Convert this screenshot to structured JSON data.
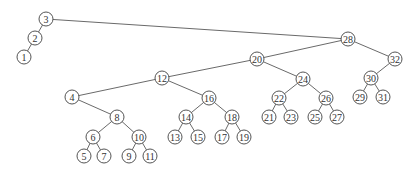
{
  "diagram": {
    "type": "binary-search-tree",
    "node_radius": 7,
    "colors": {
      "edge": "#6a6a6a",
      "node_stroke": "#555555",
      "node_fill": "#ffffff",
      "text": "#333333"
    },
    "nodes": [
      {
        "id": "3",
        "label": "3",
        "x": 46,
        "y": 19
      },
      {
        "id": "2",
        "label": "2",
        "x": 35,
        "y": 38
      },
      {
        "id": "1",
        "label": "1",
        "x": 24,
        "y": 57
      },
      {
        "id": "28",
        "label": "28",
        "x": 348,
        "y": 39
      },
      {
        "id": "20",
        "label": "20",
        "x": 257,
        "y": 59
      },
      {
        "id": "32",
        "label": "32",
        "x": 395,
        "y": 59
      },
      {
        "id": "12",
        "label": "12",
        "x": 162,
        "y": 78
      },
      {
        "id": "24",
        "label": "24",
        "x": 303,
        "y": 79
      },
      {
        "id": "30",
        "label": "30",
        "x": 371,
        "y": 78
      },
      {
        "id": "4",
        "label": "4",
        "x": 72,
        "y": 97
      },
      {
        "id": "16",
        "label": "16",
        "x": 209,
        "y": 98
      },
      {
        "id": "22",
        "label": "22",
        "x": 279,
        "y": 98
      },
      {
        "id": "26",
        "label": "26",
        "x": 326,
        "y": 98
      },
      {
        "id": "29",
        "label": "29",
        "x": 360,
        "y": 97
      },
      {
        "id": "31",
        "label": "31",
        "x": 383,
        "y": 97
      },
      {
        "id": "8",
        "label": "8",
        "x": 117,
        "y": 117
      },
      {
        "id": "14",
        "label": "14",
        "x": 186,
        "y": 117
      },
      {
        "id": "18",
        "label": "18",
        "x": 232,
        "y": 117
      },
      {
        "id": "21",
        "label": "21",
        "x": 269,
        "y": 117
      },
      {
        "id": "23",
        "label": "23",
        "x": 291,
        "y": 117
      },
      {
        "id": "25",
        "label": "25",
        "x": 315,
        "y": 117
      },
      {
        "id": "27",
        "label": "27",
        "x": 337,
        "y": 117
      },
      {
        "id": "6",
        "label": "6",
        "x": 93,
        "y": 137
      },
      {
        "id": "10",
        "label": "10",
        "x": 139,
        "y": 137
      },
      {
        "id": "13",
        "label": "13",
        "x": 175,
        "y": 137
      },
      {
        "id": "15",
        "label": "15",
        "x": 198,
        "y": 137
      },
      {
        "id": "17",
        "label": "17",
        "x": 222,
        "y": 137
      },
      {
        "id": "19",
        "label": "19",
        "x": 244,
        "y": 137
      },
      {
        "id": "5",
        "label": "5",
        "x": 84,
        "y": 156
      },
      {
        "id": "7",
        "label": "7",
        "x": 104,
        "y": 156
      },
      {
        "id": "9",
        "label": "9",
        "x": 129,
        "y": 156
      },
      {
        "id": "11",
        "label": "11",
        "x": 150,
        "y": 156
      }
    ],
    "edges": [
      [
        "3",
        "2"
      ],
      [
        "2",
        "1"
      ],
      [
        "3",
        "28"
      ],
      [
        "28",
        "20"
      ],
      [
        "28",
        "32"
      ],
      [
        "20",
        "12"
      ],
      [
        "20",
        "24"
      ],
      [
        "32",
        "30"
      ],
      [
        "30",
        "29"
      ],
      [
        "30",
        "31"
      ],
      [
        "12",
        "4"
      ],
      [
        "12",
        "16"
      ],
      [
        "4",
        "8"
      ],
      [
        "8",
        "6"
      ],
      [
        "8",
        "10"
      ],
      [
        "6",
        "5"
      ],
      [
        "6",
        "7"
      ],
      [
        "10",
        "9"
      ],
      [
        "10",
        "11"
      ],
      [
        "16",
        "14"
      ],
      [
        "16",
        "18"
      ],
      [
        "14",
        "13"
      ],
      [
        "14",
        "15"
      ],
      [
        "18",
        "17"
      ],
      [
        "18",
        "19"
      ],
      [
        "24",
        "22"
      ],
      [
        "24",
        "26"
      ],
      [
        "22",
        "21"
      ],
      [
        "22",
        "23"
      ],
      [
        "26",
        "25"
      ],
      [
        "26",
        "27"
      ]
    ]
  }
}
